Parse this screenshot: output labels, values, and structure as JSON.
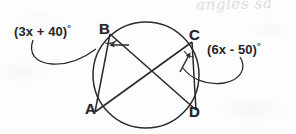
{
  "figure": {
    "kind": "circle-geometry-diagram",
    "colors": {
      "ink": "#2b2b2f",
      "background": "#fdfdfd",
      "handwriting": "#d8d8d8"
    },
    "circle": {
      "center_x": 146,
      "center_y": 75,
      "radius": 53
    },
    "points": [
      {
        "name": "A",
        "label": "A",
        "x": 95,
        "y": 112
      },
      {
        "name": "B",
        "label": "B",
        "x": 110,
        "y": 34
      },
      {
        "name": "C",
        "label": "C",
        "x": 192,
        "y": 42
      },
      {
        "name": "D",
        "label": "D",
        "x": 196,
        "y": 110
      }
    ],
    "chords": [
      {
        "name": "chord-ba",
        "from": "B",
        "to": "A"
      },
      {
        "name": "chord-cd",
        "from": "C",
        "to": "D"
      },
      {
        "name": "chord-bd",
        "from": "B",
        "to": "D"
      },
      {
        "name": "chord-ac",
        "from": "A",
        "to": "C"
      }
    ],
    "angle_labels": [
      {
        "name": "angle-at-b",
        "text": "(3x + 40)",
        "degree_symbol": "°",
        "expression": "3x + 40",
        "points_to_vertex": "B",
        "side": "left"
      },
      {
        "name": "angle-at-c",
        "text": "(6x - 50)",
        "degree_symbol": "°",
        "expression": "6x - 50",
        "points_to_vertex": "C",
        "side": "right"
      }
    ],
    "handwriting": {
      "text": "angles sa",
      "note": "faint gray cursive, cropped at top edge"
    }
  }
}
